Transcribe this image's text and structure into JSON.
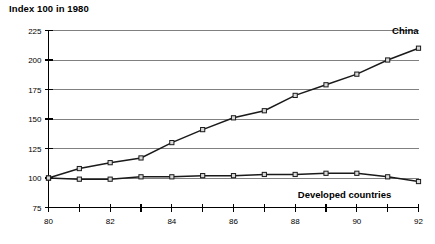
{
  "chart_data": {
    "type": "line",
    "title": "Index 100 in 1980",
    "xlabel": "",
    "ylabel": "",
    "xlim": [
      80,
      92
    ],
    "ylim": [
      75,
      225
    ],
    "yticks": [
      75,
      100,
      125,
      150,
      175,
      200,
      225
    ],
    "ytick_labels": [
      "75",
      "100",
      "125",
      "150",
      "175",
      "200",
      "225"
    ],
    "x": [
      80,
      81,
      82,
      83,
      84,
      85,
      86,
      87,
      88,
      89,
      90,
      91,
      92
    ],
    "xticks": [
      80,
      81,
      82,
      83,
      84,
      85,
      86,
      87,
      88,
      89,
      90,
      91,
      92
    ],
    "xtick_labels": [
      "80",
      "",
      "82",
      "",
      "84",
      "",
      "86",
      "",
      "88",
      "",
      "90",
      "",
      "92"
    ],
    "grid": true,
    "grid_axis": "y",
    "legend_position": "inline-annotation",
    "series": [
      {
        "name": "China",
        "label": "China",
        "label_x": 92,
        "label_y": 222,
        "values": [
          100,
          108,
          113,
          117,
          130,
          141,
          151,
          157,
          170,
          179,
          188,
          200,
          210
        ],
        "marker": "square",
        "color": "#1a1a1a"
      },
      {
        "name": "Developed countries",
        "label": "Developed countries",
        "label_x": 89.6,
        "label_y": 83,
        "values": [
          100,
          99,
          99,
          101,
          101,
          102,
          102,
          103,
          103,
          104,
          104,
          101,
          97
        ],
        "marker": "square",
        "color": "#1a1a1a"
      }
    ]
  },
  "annotations": {
    "china_label": "China",
    "developed_label": "Developed countries"
  }
}
